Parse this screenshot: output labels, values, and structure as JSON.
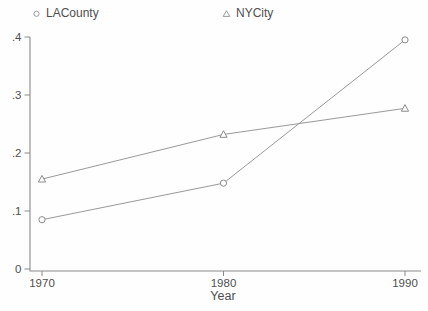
{
  "chart_data": {
    "type": "line",
    "x": [
      1970,
      1980,
      1990
    ],
    "series": [
      {
        "name": "LACounty",
        "marker": "circle",
        "values": [
          0.085,
          0.148,
          0.395
        ]
      },
      {
        "name": "NYCity",
        "marker": "triangle",
        "values": [
          0.155,
          0.232,
          0.277
        ]
      }
    ],
    "title": "",
    "xlabel": "Year",
    "ylabel": "",
    "xlim": [
      1970,
      1990
    ],
    "ylim": [
      0,
      0.4
    ],
    "xticks": [
      {
        "value": 1970,
        "label": "1970"
      },
      {
        "value": 1980,
        "label": "1980"
      },
      {
        "value": 1990,
        "label": "1990"
      }
    ],
    "yticks": [
      {
        "value": 0.0,
        "label": "0"
      },
      {
        "value": 0.1,
        "label": ".1"
      },
      {
        "value": 0.2,
        "label": ".2"
      },
      {
        "value": 0.3,
        "label": ".3"
      },
      {
        "value": 0.4,
        "label": ".4"
      }
    ],
    "grid": false,
    "legend_position": "top",
    "colors": {
      "line": "#999999",
      "marker_stroke": "#8c8c8c",
      "marker_fill": "#fefefe",
      "axis": "#8a8a8a",
      "text": "#4f4f4f",
      "background": "#fefefe"
    }
  }
}
